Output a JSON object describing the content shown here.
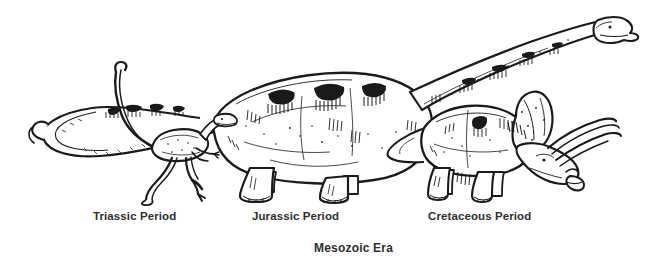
{
  "figure": {
    "title": "Mesozoic Era",
    "background_color": "#ffffff",
    "ink_color": "#1a1a1a",
    "text_color": "#2e2e2e",
    "style": "black-and-white pen-and-ink line engraving"
  },
  "labels": {
    "triassic": "Triassic Period",
    "jurassic": "Jurassic Period",
    "cretaceous": "Cretaceous Period",
    "era": "Mesozoic Era"
  },
  "creatures": [
    {
      "id": "triassic-theropod",
      "name": "small bipedal theropod",
      "period": "Triassic Period",
      "facing": "right",
      "posture": "striding bipedal",
      "approx_bbox": [
        110,
        118,
        120,
        85
      ]
    },
    {
      "id": "jurassic-sauropod",
      "name": "long-necked sauropod",
      "period": "Jurassic Period",
      "facing": "right",
      "posture": "quadrupedal with raised neck and looping tail",
      "approx_bbox": [
        30,
        12,
        600,
        190
      ]
    },
    {
      "id": "cretaceous-ceratopsian",
      "name": "horned ceratopsian with neck frill",
      "period": "Cretaceous Period",
      "facing": "right",
      "posture": "quadrupedal browsing, head lowered",
      "approx_bbox": [
        390,
        95,
        240,
        110
      ]
    }
  ]
}
